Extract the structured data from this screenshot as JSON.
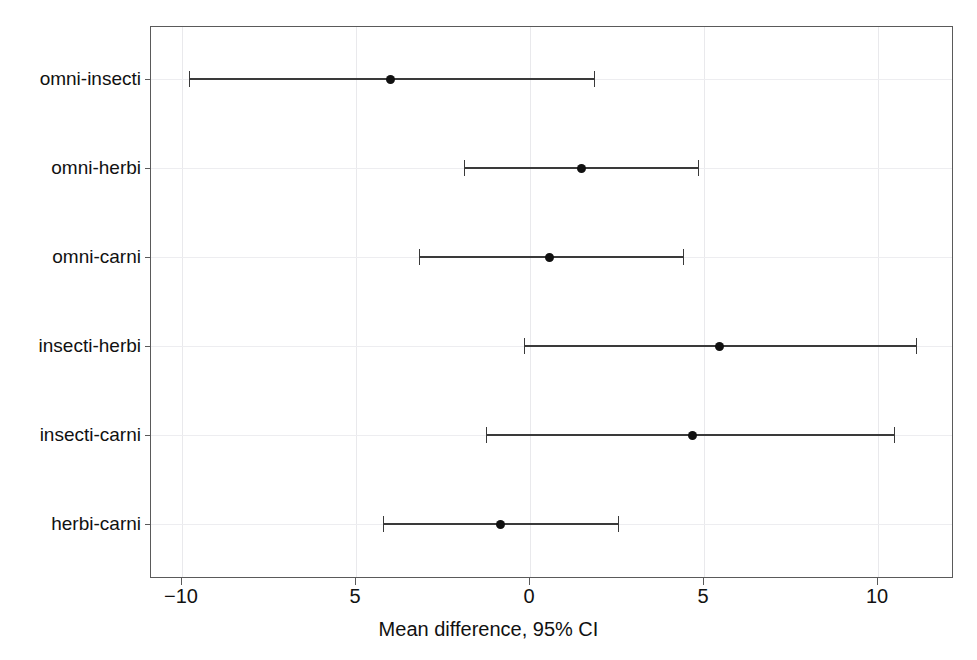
{
  "chart_data": {
    "type": "scatter",
    "title": "",
    "subtitle": "",
    "xlabel": "Mean difference, 95% CI",
    "ylabel": "",
    "xlim": [
      -10.89,
      12.18
    ],
    "xticks": [
      -10,
      -5,
      0,
      5,
      10
    ],
    "xtick_labels": [
      "−10",
      "5",
      "0",
      "5",
      "10"
    ],
    "grid": true,
    "legend": null,
    "reference_line": 0,
    "orientation": "horizontal",
    "categories": [
      "omni-insecti",
      "omni-herbi",
      "omni-carni",
      "insecti-herbi",
      "insecti-carni",
      "herbi-carni"
    ],
    "points": [
      {
        "label": "omni-insecti",
        "estimate": -4.0,
        "ci_low": -9.8,
        "ci_high": 1.84
      },
      {
        "label": "omni-herbi",
        "estimate": 1.47,
        "ci_low": -1.9,
        "ci_high": 4.83
      },
      {
        "label": "omni-carni",
        "estimate": 0.55,
        "ci_low": -3.19,
        "ci_high": 4.4
      },
      {
        "label": "insecti-herbi",
        "estimate": 5.43,
        "ci_low": -0.17,
        "ci_high": 11.09
      },
      {
        "label": "insecti-carni",
        "estimate": 4.68,
        "ci_low": -1.26,
        "ci_high": 10.46
      },
      {
        "label": "herbi-carni",
        "estimate": -0.86,
        "ci_low": -4.22,
        "ci_high": 2.53
      }
    ],
    "estimates": [
      -4.0,
      1.47,
      0.55,
      5.43,
      4.68,
      -0.86
    ],
    "ci_low": [
      -9.8,
      -1.9,
      -3.19,
      -0.17,
      -1.26,
      -4.22
    ],
    "ci_high": [
      1.84,
      4.83,
      4.4,
      11.09,
      10.46,
      2.53
    ],
    "colors": {
      "marker": "#111111",
      "line": "#3a3a3a",
      "frame": "#5a5a5a",
      "zero_line": "#4a4a4a",
      "grid": "#ededf0",
      "background": "#ffffff",
      "text": "#111111"
    }
  }
}
